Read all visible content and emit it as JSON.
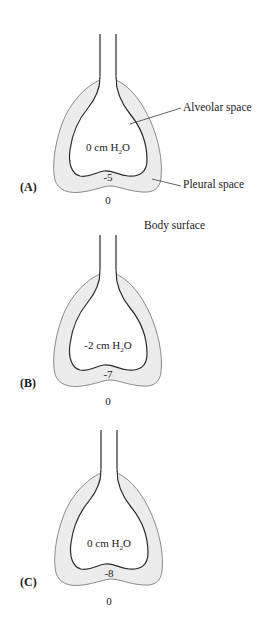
{
  "figure": {
    "callouts": {
      "alveolar": "Alveolar space",
      "pleural": "Pleural space",
      "body_surface": "Body surface"
    },
    "panels": [
      {
        "label": "(A)",
        "alveolar_pressure_value": "0",
        "alveolar_pressure_unit_prefix": " cm H",
        "alveolar_pressure_subscript": "2",
        "alveolar_pressure_unit_suffix": "O",
        "pleural_pressure": "-5",
        "body_surface_pressure": "0"
      },
      {
        "label": "(B)",
        "alveolar_pressure_value": "-2",
        "alveolar_pressure_unit_prefix": " cm H",
        "alveolar_pressure_subscript": "2",
        "alveolar_pressure_unit_suffix": "O",
        "pleural_pressure": "-7",
        "body_surface_pressure": "0"
      },
      {
        "label": "(C)",
        "alveolar_pressure_value": "0",
        "alveolar_pressure_unit_prefix": " cm H",
        "alveolar_pressure_subscript": "2",
        "alveolar_pressure_unit_suffix": "O",
        "pleural_pressure": "-8",
        "body_surface_pressure": "0"
      }
    ]
  }
}
